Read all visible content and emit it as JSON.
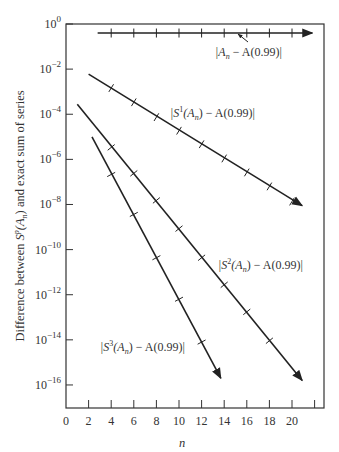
{
  "chart_data": {
    "type": "line",
    "title": "",
    "xlabel": "n",
    "ylabel": "Difference between S^p(A_n) and exact sum of series",
    "ylabel_parts": {
      "prefix": "Difference between ",
      "s": "S",
      "p": "p",
      "mid": "(A",
      "n": "n",
      "suffix": ") and exact sum of series"
    },
    "yscale": "log",
    "xlim": [
      0,
      23
    ],
    "ylim_log10": [
      -17,
      0
    ],
    "grid": false,
    "legend": "inline labels",
    "x_ticks": [
      0,
      2,
      4,
      6,
      8,
      10,
      12,
      14,
      16,
      18,
      20,
      22
    ],
    "x_tick_labels": [
      "0",
      "2",
      "4",
      "6",
      "8",
      "10",
      "12",
      "14",
      "16",
      "18",
      "20",
      ""
    ],
    "y_ticks_log10": [
      0,
      -2,
      -4,
      -6,
      -8,
      -10,
      -12,
      -14,
      -16
    ],
    "y_tick_labels": [
      {
        "base": "10",
        "exp": "0"
      },
      {
        "base": "10",
        "exp": "−2"
      },
      {
        "base": "10",
        "exp": "−4"
      },
      {
        "base": "10",
        "exp": "−6"
      },
      {
        "base": "10",
        "exp": "−8"
      },
      {
        "base": "10",
        "exp": "−10"
      },
      {
        "base": "10",
        "exp": "−12"
      },
      {
        "base": "10",
        "exp": "−14"
      },
      {
        "base": "10",
        "exp": "−16"
      }
    ],
    "series": [
      {
        "name": "|A_n − A(0.99)|",
        "label_parts": {
          "pre": "|A",
          "sub": "n",
          "post": " − A(0.99)|"
        },
        "start": [
          2.8,
          -0.4
        ],
        "end": [
          21.8,
          -0.4
        ],
        "marks_n": [
          4,
          6,
          8,
          10,
          12,
          14,
          16,
          18,
          20
        ],
        "log10_values": [
          -0.4,
          -0.4,
          -0.4,
          -0.4,
          -0.4,
          -0.4,
          -0.4,
          -0.4,
          -0.4
        ],
        "label_pos": [
          215,
          56
        ],
        "pointer": {
          "from": [
            248,
            42
          ],
          "to": [
            238,
            34
          ]
        }
      },
      {
        "name": "|S^1(A_n) − A(0.99)|",
        "label_parts": {
          "pre": "|S",
          "sup": "1",
          "mid": "(A",
          "sub": "n",
          "post": ") − A(0.99)|"
        },
        "start": [
          2,
          -2.22
        ],
        "end": [
          20.9,
          -8.05
        ],
        "marks_n": [
          4,
          6,
          8,
          10,
          12,
          14,
          16,
          18,
          20
        ],
        "log10_values": [
          -2.84,
          -3.47,
          -4.13,
          -4.73,
          -5.33,
          -5.96,
          -6.58,
          -7.2,
          -7.87
        ],
        "label_pos": [
          170,
          117
        ]
      },
      {
        "name": "|S^2(A_n) − A(0.99)|",
        "label_parts": {
          "pre": "|S",
          "sup": "2",
          "mid": "(A",
          "sub": "n",
          "post": ") − A(0.99)|"
        },
        "start": [
          1,
          -3.56
        ],
        "end": [
          20.9,
          -15.8
        ],
        "marks_n": [
          4,
          6,
          8,
          10,
          12,
          14,
          16,
          18
        ],
        "log10_values": [
          -5.47,
          -6.62,
          -7.82,
          -9.07,
          -10.36,
          -11.56,
          -12.76,
          -14.04
        ],
        "label_pos": [
          218,
          269
        ]
      },
      {
        "name": "|S^3(A_n) − A(0.99)|",
        "label_parts": {
          "pre": "|S",
          "sup": "3",
          "mid": "(A",
          "sub": "n",
          "post": ") − A(0.99)|"
        },
        "start": [
          2.3,
          -5.0
        ],
        "end": [
          13.7,
          -15.7
        ],
        "marks_n": [
          4,
          6,
          8,
          10,
          12
        ],
        "log10_values": [
          -6.67,
          -8.44,
          -10.36,
          -12.2,
          -14.1
        ],
        "label_pos": [
          100,
          351
        ]
      }
    ]
  }
}
